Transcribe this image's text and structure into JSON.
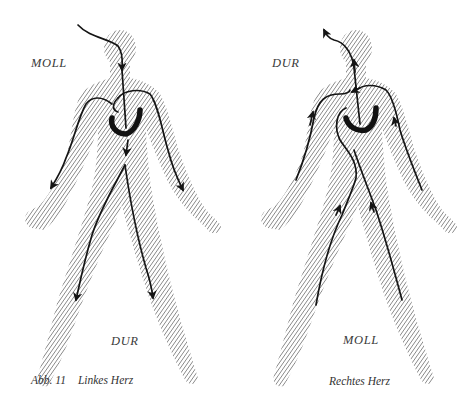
{
  "figure": {
    "number_label": "Abb. 11",
    "left": {
      "title": "Linkes Herz",
      "top_label": "MOLL",
      "bottom_label": "DUR"
    },
    "right": {
      "title": "Rechtes Herz",
      "top_label": "DUR",
      "bottom_label": "MOLL"
    }
  },
  "colors": {
    "background": "#ffffff",
    "hatch": "#8a8a8a",
    "arrow": "#151515",
    "text": "#3a3a3a"
  }
}
